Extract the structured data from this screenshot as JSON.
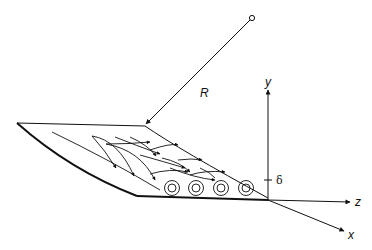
{
  "diagram": {
    "labels": {
      "radius": "R",
      "y_axis": "y",
      "z_axis": "z",
      "x_axis": "x",
      "thickness": "δ"
    },
    "vortex_count": 4,
    "colors": {
      "line": "#111111",
      "background": "#ffffff"
    }
  }
}
